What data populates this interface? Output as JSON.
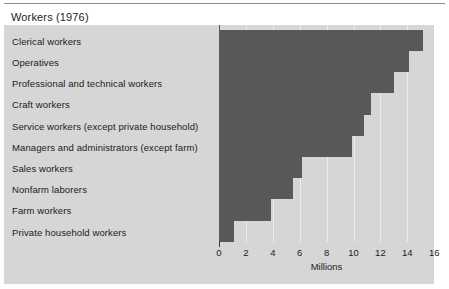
{
  "figure": {
    "title": "Workers (1976)"
  },
  "chart_data": {
    "type": "bar",
    "orientation": "horizontal",
    "title": "Workers (1976)",
    "xlabel": "Millions",
    "ylabel": "",
    "xlim": [
      0,
      16
    ],
    "xticks": [
      0,
      2,
      4,
      6,
      8,
      10,
      12,
      14,
      16
    ],
    "xtick_labels": [
      "0",
      "2",
      "4",
      "6",
      "8",
      "10",
      "12",
      "14",
      "16"
    ],
    "grid": true,
    "grid_axis": "x",
    "legend": false,
    "bar_color": "#58585a",
    "panel_color": "#d6d6d6",
    "gridline_color": "#ebebeb",
    "categories": [
      "Clerical workers",
      "Operatives",
      "Professional and technical workers",
      "Craft workers",
      "Service workers (except private household)",
      "Managers and administrators (except farm)",
      "Sales workers",
      "Nonfarm laborers",
      "Farm workers",
      "Private household workers"
    ],
    "values": [
      15.2,
      14.1,
      13.0,
      11.3,
      10.8,
      9.9,
      6.2,
      5.5,
      3.9,
      1.1
    ],
    "units": "Millions"
  }
}
